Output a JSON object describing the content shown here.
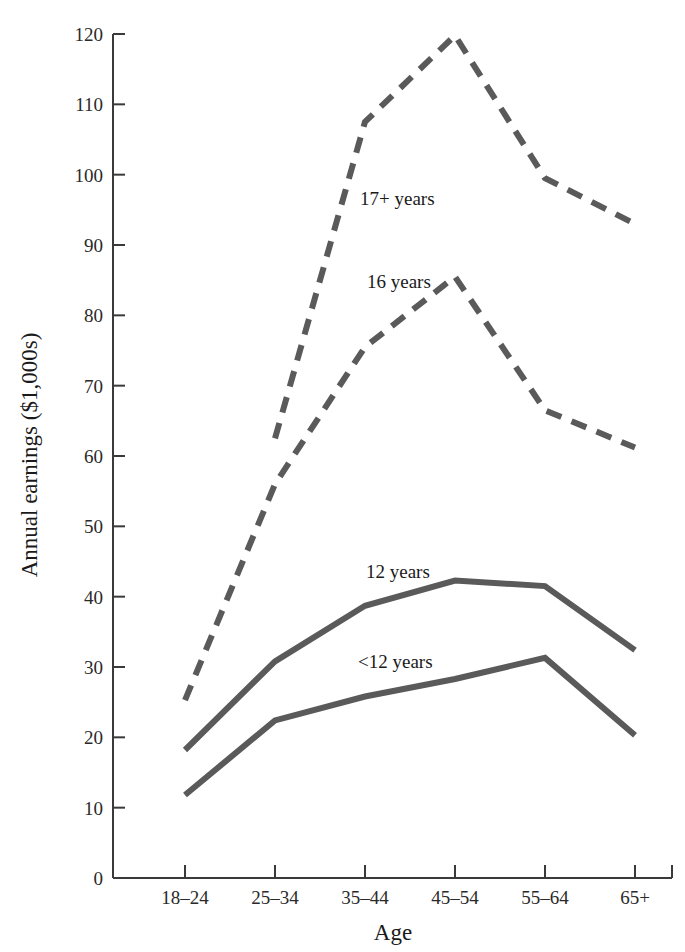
{
  "chart_data": {
    "type": "line",
    "title": "",
    "xlabel": "Age",
    "ylabel": "Annual earnings ($1,000s)",
    "categories": [
      "18–24",
      "25–34",
      "35–44",
      "45–54",
      "55–64",
      "65+"
    ],
    "ylim": [
      0,
      120
    ],
    "yticks": [
      0,
      10,
      20,
      30,
      40,
      50,
      60,
      70,
      80,
      90,
      100,
      110,
      120
    ],
    "ytick_labels": [
      "0",
      "10",
      "20",
      "30",
      "40",
      "50",
      "60",
      "70",
      "80",
      "90",
      "100",
      "110",
      "120"
    ],
    "grid": false,
    "legend_position": "inline-labels",
    "series": [
      {
        "name": "17+ years",
        "label": "17+ years",
        "style": "dashed",
        "color": "#5a5a5a",
        "x_start_index": 1,
        "values": [
          null,
          62.5,
          107.5,
          119.8,
          99.5,
          93.0
        ]
      },
      {
        "name": "16 years",
        "label": "16 years",
        "style": "dashed",
        "color": "#5a5a5a",
        "x_start_index": 0,
        "values": [
          25.3,
          56.0,
          75.5,
          85.5,
          66.5,
          61.2
        ]
      },
      {
        "name": "12 years",
        "label": "12 years",
        "style": "solid",
        "color": "#5a5a5a",
        "x_start_index": 0,
        "values": [
          18.2,
          30.8,
          38.7,
          42.3,
          41.5,
          32.4
        ]
      },
      {
        "name": "<12 years",
        "label": "<12 years",
        "style": "solid",
        "color": "#5a5a5a",
        "x_start_index": 0,
        "values": [
          11.8,
          22.4,
          25.8,
          28.3,
          31.3,
          20.3
        ]
      }
    ],
    "annotations": [
      {
        "text": "17+ years",
        "x_px": 360,
        "y_px": 205
      },
      {
        "text": "16 years",
        "x_px": 367,
        "y_px": 288
      },
      {
        "text": "12 years",
        "x_px": 366,
        "y_px": 578
      },
      {
        "text": "<12 years",
        "x_px": 358,
        "y_px": 668
      }
    ]
  }
}
